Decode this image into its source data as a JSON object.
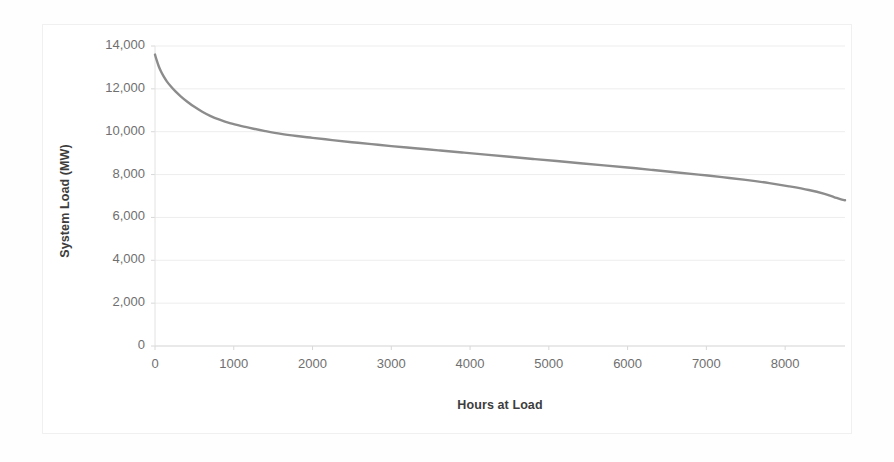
{
  "chart_data": {
    "type": "line",
    "title": "",
    "xlabel": "Hours at Load",
    "ylabel": "System Load (MW)",
    "xlim": [
      0,
      8760
    ],
    "ylim": [
      0,
      14000
    ],
    "grid": true,
    "legend": false,
    "line_color": "#8c8c8c",
    "xticks": [
      0,
      1000,
      2000,
      3000,
      4000,
      5000,
      6000,
      7000,
      8000
    ],
    "xtick_labels": [
      "0",
      "1000",
      "2000",
      "3000",
      "4000",
      "5000",
      "6000",
      "7000",
      "8000"
    ],
    "yticks": [
      0,
      2000,
      4000,
      6000,
      8000,
      10000,
      12000,
      14000
    ],
    "ytick_labels": [
      "0",
      "2,000",
      "4,000",
      "6,000",
      "8,000",
      "10,000",
      "12,000",
      "14,000"
    ],
    "series": [
      {
        "name": "Load Duration Curve",
        "x": [
          0,
          20,
          45,
          75,
          110,
          150,
          200,
          260,
          330,
          410,
          500,
          600,
          700,
          820,
          950,
          1100,
          1250,
          1400,
          1600,
          1800,
          2000,
          2250,
          2500,
          2750,
          3000,
          3300,
          3600,
          3900,
          4200,
          4500,
          4800,
          5100,
          5400,
          5700,
          6000,
          6300,
          6600,
          6900,
          7200,
          7500,
          7800,
          8050,
          8300,
          8500,
          8620,
          8700,
          8760
        ],
        "y": [
          13600,
          13350,
          13080,
          12820,
          12580,
          12350,
          12120,
          11880,
          11640,
          11400,
          11160,
          10930,
          10740,
          10560,
          10400,
          10260,
          10140,
          10030,
          9900,
          9800,
          9715,
          9610,
          9510,
          9420,
          9330,
          9230,
          9130,
          9030,
          8930,
          8830,
          8730,
          8630,
          8530,
          8430,
          8330,
          8220,
          8110,
          8000,
          7880,
          7750,
          7600,
          7450,
          7280,
          7100,
          6950,
          6850,
          6800
        ]
      }
    ]
  },
  "axis": {
    "ylabel_text": "System Load (MW)",
    "xlabel_text": "Hours at Load"
  }
}
